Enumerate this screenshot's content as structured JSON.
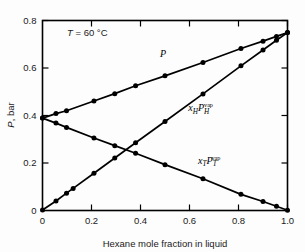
{
  "chart_data": {
    "type": "line",
    "title": "",
    "subtitle": "",
    "xlabel": "Hexane mole fraction in liquid",
    "ylabel": "P, bar",
    "ylabel_symbol": "P",
    "ylabel_unit": ", bar",
    "xlim": [
      0,
      1.0
    ],
    "ylim": [
      0,
      0.8
    ],
    "xticks": [
      "0",
      "0.2",
      "0.4",
      "0.6",
      "0.8",
      "1.0"
    ],
    "xtick_values": [
      0,
      0.2,
      0.4,
      0.6,
      0.8,
      1.0
    ],
    "yticks": [
      "0",
      "0.2",
      "0.4",
      "0.6",
      "0.8"
    ],
    "ytick_values": [
      0,
      0.2,
      0.4,
      0.6,
      0.8
    ],
    "grid": false,
    "legend_position": "inline-annotations",
    "annotations": [
      {
        "name": "temperature-annotation",
        "text": "T = 60 °C",
        "symbol": "T",
        "rest": " = 60 °C",
        "x": 0.1,
        "y": 0.735
      }
    ],
    "series": [
      {
        "name": "P",
        "label_parts": {
          "base": "P",
          "sub": "",
          "sup": ""
        },
        "label_x": 0.48,
        "label_y": 0.645,
        "marker": "filled-circle",
        "x": [
          0.0,
          0.055,
          0.098,
          0.21,
          0.295,
          0.38,
          0.5,
          0.655,
          0.81,
          0.9,
          0.955,
          1.0
        ],
        "y": [
          0.389,
          0.408,
          0.42,
          0.461,
          0.492,
          0.525,
          0.567,
          0.623,
          0.682,
          0.713,
          0.733,
          0.749
        ]
      },
      {
        "name": "xH PH vap",
        "label_parts": {
          "base": "x",
          "sub": "H",
          "base2": "P",
          "sub2": "H",
          "sup": "vap"
        },
        "label_x": 0.595,
        "label_y": 0.418,
        "marker": "filled-circle",
        "x": [
          0.0,
          0.055,
          0.098,
          0.125,
          0.21,
          0.295,
          0.38,
          0.5,
          0.655,
          0.81,
          0.9,
          0.955,
          1.0
        ],
        "y": [
          0.002,
          0.04,
          0.073,
          0.093,
          0.157,
          0.221,
          0.285,
          0.375,
          0.491,
          0.609,
          0.676,
          0.717,
          0.749
        ]
      },
      {
        "name": "xT PT vap",
        "label_parts": {
          "base": "x",
          "sub": "T",
          "base2": "P",
          "sub2": "T",
          "sup": "vap"
        },
        "label_x": 0.635,
        "label_y": 0.196,
        "marker": "filled-circle",
        "x": [
          0.0,
          0.055,
          0.098,
          0.21,
          0.295,
          0.38,
          0.5,
          0.655,
          0.81,
          0.9,
          0.955,
          1.0
        ],
        "y": [
          0.389,
          0.368,
          0.35,
          0.305,
          0.273,
          0.241,
          0.193,
          0.134,
          0.068,
          0.038,
          0.018,
          0.001
        ]
      }
    ]
  },
  "colors": {
    "axis": "#000000",
    "series": "#000000",
    "background": "#fdfdfd",
    "text": "#1a1a1a"
  }
}
